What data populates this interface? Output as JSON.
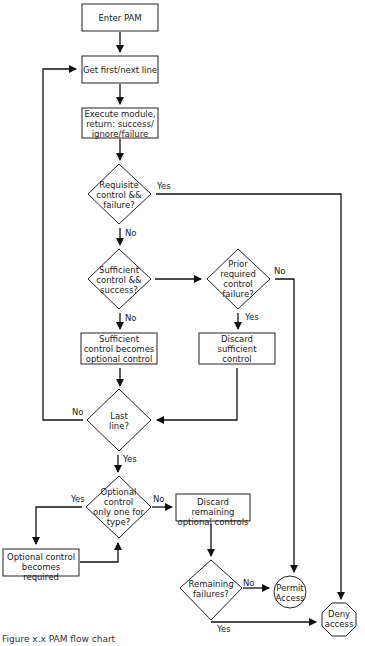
{
  "nodes": {
    "enter": "Enter PAM",
    "get_line": "Get first/next line",
    "execute": [
      "Execute module,",
      "return: success/",
      "ignore/failure"
    ],
    "requisite": [
      "Requisite",
      "control &&",
      "failure?"
    ],
    "sufficient": [
      "Sufficient",
      "control &&",
      "success?"
    ],
    "prior": [
      "Prior",
      "required",
      "control",
      "failure?"
    ],
    "suff_optional": [
      "Sufficient",
      "control becomes",
      "optional control"
    ],
    "discard_suff": [
      "Discard",
      "sufficient",
      "control"
    ],
    "last_line": [
      "Last",
      "line?"
    ],
    "optional_only": [
      "Optional",
      "control",
      "only one for",
      "type?"
    ],
    "discard_remaining": [
      "Discard remaining",
      "optional controls"
    ],
    "opt_required": [
      "Optional control",
      "becomes required"
    ],
    "remaining_failures": [
      "Remaining",
      "failures?"
    ],
    "permit": [
      "Permit",
      "Access"
    ],
    "deny": [
      "Deny",
      "access"
    ]
  },
  "edges": {
    "yes": "Yes",
    "no": "No"
  },
  "caption": "Figure x.x PAM flow chart"
}
